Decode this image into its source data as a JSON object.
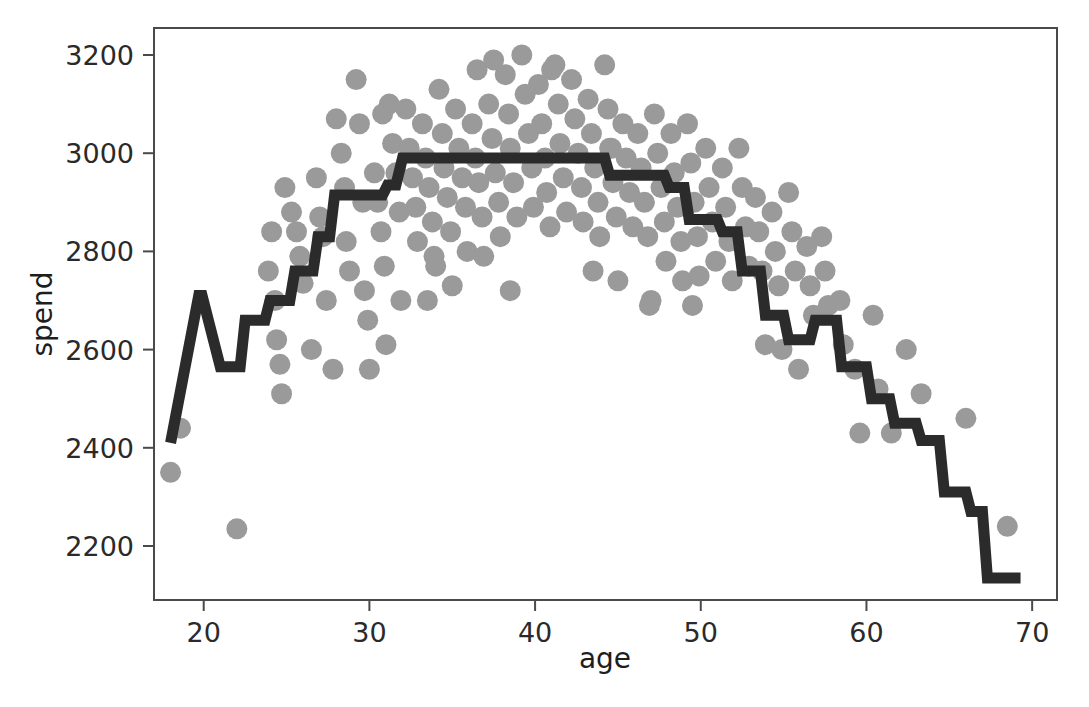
{
  "chart_data": {
    "type": "scatter",
    "title": "",
    "xlabel": "age",
    "ylabel": "spend",
    "xlim": [
      17.0,
      71.5
    ],
    "ylim": [
      2090,
      3255
    ],
    "xticks": [
      20,
      30,
      40,
      50,
      60,
      70
    ],
    "yticks": [
      2200,
      2400,
      2600,
      2800,
      3000,
      3200
    ],
    "grid": false,
    "legend": null,
    "marker_color": "#9a9a9a",
    "line_color": "#2b2b2b",
    "frame_color": "#4a4a4a",
    "background": "#ffffff",
    "series": [
      {
        "name": "observations",
        "type": "scatter",
        "marker": "circle",
        "points": [
          [
            18.0,
            2350
          ],
          [
            18.6,
            2440
          ],
          [
            22.0,
            2235
          ],
          [
            24.1,
            2840
          ],
          [
            24.3,
            2700
          ],
          [
            24.4,
            2620
          ],
          [
            24.6,
            2570
          ],
          [
            24.7,
            2510
          ],
          [
            25.6,
            2840
          ],
          [
            25.8,
            2790
          ],
          [
            26.0,
            2735
          ],
          [
            27.0,
            2870
          ],
          [
            27.2,
            2830
          ],
          [
            27.4,
            2700
          ],
          [
            28.3,
            3000
          ],
          [
            28.5,
            2930
          ],
          [
            28.6,
            2820
          ],
          [
            28.8,
            2760
          ],
          [
            29.2,
            3150
          ],
          [
            29.4,
            3060
          ],
          [
            29.6,
            2900
          ],
          [
            29.7,
            2720
          ],
          [
            29.9,
            2660
          ],
          [
            30.3,
            2960
          ],
          [
            30.5,
            2900
          ],
          [
            30.7,
            2840
          ],
          [
            30.9,
            2770
          ],
          [
            31.2,
            3100
          ],
          [
            31.4,
            3020
          ],
          [
            31.6,
            2960
          ],
          [
            31.8,
            2880
          ],
          [
            31.9,
            2700
          ],
          [
            32.2,
            3090
          ],
          [
            32.4,
            3010
          ],
          [
            32.6,
            2950
          ],
          [
            32.8,
            2890
          ],
          [
            32.9,
            2820
          ],
          [
            33.2,
            3060
          ],
          [
            33.4,
            2990
          ],
          [
            33.6,
            2930
          ],
          [
            33.8,
            2860
          ],
          [
            33.9,
            2790
          ],
          [
            34.2,
            3130
          ],
          [
            34.4,
            3040
          ],
          [
            34.5,
            2970
          ],
          [
            34.7,
            2910
          ],
          [
            34.9,
            2840
          ],
          [
            35.2,
            3090
          ],
          [
            35.4,
            3010
          ],
          [
            35.6,
            2950
          ],
          [
            35.8,
            2890
          ],
          [
            35.9,
            2800
          ],
          [
            36.2,
            3060
          ],
          [
            36.4,
            2990
          ],
          [
            36.6,
            2940
          ],
          [
            36.8,
            2870
          ],
          [
            36.9,
            2790
          ],
          [
            37.2,
            3100
          ],
          [
            37.4,
            3030
          ],
          [
            37.6,
            2960
          ],
          [
            37.8,
            2900
          ],
          [
            37.9,
            2830
          ],
          [
            38.2,
            3160
          ],
          [
            38.4,
            3080
          ],
          [
            38.5,
            3010
          ],
          [
            38.7,
            2940
          ],
          [
            38.9,
            2870
          ],
          [
            39.2,
            3200
          ],
          [
            39.4,
            3120
          ],
          [
            39.6,
            3040
          ],
          [
            39.8,
            2970
          ],
          [
            39.9,
            2890
          ],
          [
            40.2,
            3140
          ],
          [
            40.4,
            3060
          ],
          [
            40.6,
            2990
          ],
          [
            40.7,
            2920
          ],
          [
            40.9,
            2850
          ],
          [
            41.2,
            3180
          ],
          [
            41.4,
            3100
          ],
          [
            41.5,
            3020
          ],
          [
            41.7,
            2950
          ],
          [
            41.9,
            2880
          ],
          [
            42.2,
            3150
          ],
          [
            42.4,
            3070
          ],
          [
            42.6,
            3000
          ],
          [
            42.8,
            2930
          ],
          [
            42.9,
            2860
          ],
          [
            43.2,
            3110
          ],
          [
            43.4,
            3040
          ],
          [
            43.6,
            2970
          ],
          [
            43.8,
            2900
          ],
          [
            43.9,
            2830
          ],
          [
            44.2,
            3180
          ],
          [
            44.4,
            3090
          ],
          [
            44.6,
            3010
          ],
          [
            44.7,
            2940
          ],
          [
            44.9,
            2870
          ],
          [
            45.3,
            3060
          ],
          [
            45.5,
            2990
          ],
          [
            45.7,
            2920
          ],
          [
            45.9,
            2850
          ],
          [
            46.2,
            3040
          ],
          [
            46.4,
            2970
          ],
          [
            46.6,
            2900
          ],
          [
            46.8,
            2830
          ],
          [
            46.9,
            2690
          ],
          [
            47.2,
            3080
          ],
          [
            47.4,
            3000
          ],
          [
            47.6,
            2930
          ],
          [
            47.8,
            2860
          ],
          [
            47.9,
            2780
          ],
          [
            48.2,
            3040
          ],
          [
            48.4,
            2960
          ],
          [
            48.6,
            2890
          ],
          [
            48.8,
            2820
          ],
          [
            48.9,
            2740
          ],
          [
            49.2,
            3060
          ],
          [
            49.4,
            2980
          ],
          [
            49.6,
            2900
          ],
          [
            49.8,
            2830
          ],
          [
            49.9,
            2750
          ],
          [
            50.3,
            3010
          ],
          [
            50.5,
            2930
          ],
          [
            50.7,
            2860
          ],
          [
            50.9,
            2780
          ],
          [
            51.3,
            2970
          ],
          [
            51.5,
            2890
          ],
          [
            51.7,
            2820
          ],
          [
            51.9,
            2740
          ],
          [
            52.3,
            3010
          ],
          [
            52.5,
            2930
          ],
          [
            52.7,
            2850
          ],
          [
            52.9,
            2770
          ],
          [
            53.3,
            2910
          ],
          [
            53.5,
            2840
          ],
          [
            53.7,
            2760
          ],
          [
            53.9,
            2610
          ],
          [
            54.3,
            2880
          ],
          [
            54.5,
            2800
          ],
          [
            54.7,
            2730
          ],
          [
            54.9,
            2600
          ],
          [
            55.3,
            2920
          ],
          [
            55.5,
            2840
          ],
          [
            55.7,
            2760
          ],
          [
            55.9,
            2560
          ],
          [
            56.4,
            2810
          ],
          [
            56.6,
            2730
          ],
          [
            56.8,
            2670
          ],
          [
            57.3,
            2830
          ],
          [
            57.5,
            2760
          ],
          [
            57.7,
            2690
          ],
          [
            58.4,
            2700
          ],
          [
            58.6,
            2610
          ],
          [
            59.3,
            2560
          ],
          [
            59.6,
            2430
          ],
          [
            60.4,
            2670
          ],
          [
            60.7,
            2520
          ],
          [
            61.5,
            2430
          ],
          [
            62.4,
            2600
          ],
          [
            63.3,
            2510
          ],
          [
            66.0,
            2460
          ],
          [
            68.5,
            2240
          ],
          [
            26.5,
            2600
          ],
          [
            27.8,
            2560
          ],
          [
            30.0,
            2560
          ],
          [
            31.0,
            2610
          ],
          [
            33.5,
            2700
          ],
          [
            35.0,
            2730
          ],
          [
            38.5,
            2720
          ],
          [
            34.0,
            2770
          ],
          [
            43.5,
            2760
          ],
          [
            45.0,
            2740
          ],
          [
            28.0,
            3070
          ],
          [
            30.8,
            3080
          ],
          [
            36.5,
            3170
          ],
          [
            37.5,
            3190
          ],
          [
            41.0,
            3170
          ],
          [
            44.5,
            3010
          ],
          [
            47.0,
            2700
          ],
          [
            49.5,
            2690
          ],
          [
            24.9,
            2930
          ],
          [
            25.3,
            2880
          ],
          [
            26.8,
            2950
          ],
          [
            23.9,
            2760
          ]
        ]
      },
      {
        "name": "step-fit",
        "type": "step",
        "points": [
          [
            18.0,
            2410
          ],
          [
            19.7,
            2710
          ],
          [
            19.9,
            2710
          ],
          [
            21.0,
            2565
          ],
          [
            22.2,
            2565
          ],
          [
            22.5,
            2660
          ],
          [
            23.7,
            2660
          ],
          [
            24.0,
            2700
          ],
          [
            25.2,
            2700
          ],
          [
            25.5,
            2760
          ],
          [
            26.6,
            2760
          ],
          [
            26.9,
            2830
          ],
          [
            27.6,
            2830
          ],
          [
            27.9,
            2915
          ],
          [
            30.8,
            2915
          ],
          [
            31.1,
            2935
          ],
          [
            31.6,
            2935
          ],
          [
            32.0,
            2990
          ],
          [
            44.2,
            2990
          ],
          [
            44.5,
            2955
          ],
          [
            47.8,
            2955
          ],
          [
            48.1,
            2930
          ],
          [
            49.0,
            2930
          ],
          [
            49.3,
            2865
          ],
          [
            51.0,
            2865
          ],
          [
            51.3,
            2840
          ],
          [
            52.2,
            2840
          ],
          [
            52.5,
            2760
          ],
          [
            53.6,
            2760
          ],
          [
            53.9,
            2670
          ],
          [
            55.0,
            2670
          ],
          [
            55.3,
            2620
          ],
          [
            56.6,
            2620
          ],
          [
            56.9,
            2660
          ],
          [
            58.2,
            2660
          ],
          [
            58.5,
            2565
          ],
          [
            60.0,
            2565
          ],
          [
            60.3,
            2500
          ],
          [
            61.4,
            2500
          ],
          [
            61.7,
            2450
          ],
          [
            63.0,
            2450
          ],
          [
            63.3,
            2415
          ],
          [
            64.4,
            2415
          ],
          [
            64.7,
            2310
          ],
          [
            66.0,
            2310
          ],
          [
            66.3,
            2270
          ],
          [
            67.0,
            2270
          ],
          [
            67.3,
            2135
          ],
          [
            69.3,
            2135
          ]
        ]
      }
    ]
  },
  "axes": {
    "xlabel": "age",
    "ylabel": "spend",
    "xtick_labels": [
      "20",
      "30",
      "40",
      "50",
      "60",
      "70"
    ],
    "ytick_labels": [
      "2200",
      "2400",
      "2600",
      "2800",
      "3000",
      "3200"
    ]
  }
}
